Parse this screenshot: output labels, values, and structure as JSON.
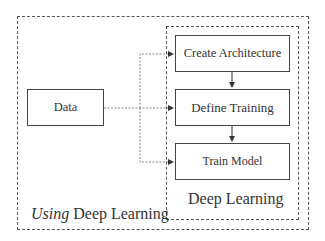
{
  "diagram": {
    "outer_label_italic": "Using",
    "outer_label_rest": " Deep Learning",
    "inner_label": "Deep Learning",
    "nodes": {
      "data": "Data",
      "create_architecture": "Create Architecture",
      "define_training": "Define Training",
      "train_model": "Train Model"
    },
    "edges": [
      {
        "from": "Data",
        "to": "Create Architecture",
        "style": "dashed"
      },
      {
        "from": "Data",
        "to": "Define Training",
        "style": "dashed"
      },
      {
        "from": "Data",
        "to": "Train Model",
        "style": "dashed"
      },
      {
        "from": "Create Architecture",
        "to": "Define Training",
        "style": "solid"
      },
      {
        "from": "Define Training",
        "to": "Train Model",
        "style": "solid"
      }
    ]
  }
}
